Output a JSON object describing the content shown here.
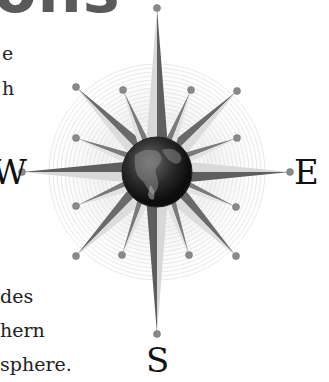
{
  "heading": {
    "text": "ons"
  },
  "body_text": {
    "lines": [
      {
        "text": "e",
        "x": 2,
        "y": 44
      },
      {
        "text": "h",
        "x": 2,
        "y": 79
      },
      {
        "text": "des",
        "x": 0,
        "y": 287
      },
      {
        "text": "hern",
        "x": 0,
        "y": 321
      },
      {
        "text": "sphere.",
        "x": 0,
        "y": 355
      }
    ]
  },
  "compass": {
    "center": {
      "x": 157,
      "y": 172
    },
    "labels": {
      "north": "N",
      "west": "W",
      "east": "E",
      "south": "S"
    },
    "globe_icon": "earth-globe",
    "colors": {
      "ray_dark": "#6a6a6a",
      "ray_light": "#d6d6d6",
      "ring": "#cfcfcf",
      "ball": "#8a8a8a",
      "globe": "#1e1e1e"
    }
  }
}
